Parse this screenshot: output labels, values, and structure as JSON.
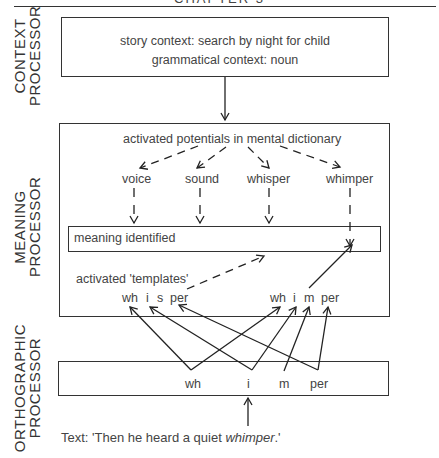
{
  "header": {
    "title": "CHAPTER 3"
  },
  "processors": {
    "context": {
      "label_line1": "CONTEXT",
      "label_line2": "PROCESSOR",
      "story_context": "story context: search by night for child",
      "grammatical_context": "grammatical context: noun"
    },
    "meaning": {
      "label_line1": "MEANING",
      "label_line2": "PROCESSOR",
      "dictionary_label": "activated potentials in mental dictionary",
      "candidates": [
        "voice",
        "sound",
        "whisper",
        "whimper"
      ],
      "identified_label": "meaning identified",
      "templates_label": "activated 'templates'",
      "template_whisper": [
        "wh",
        "i",
        "s",
        "per"
      ],
      "template_whimper": [
        "wh",
        "i",
        "m",
        "per"
      ]
    },
    "orthographic": {
      "label_line1": "ORTHOGRAPHIC",
      "label_line2": "PROCESSOR",
      "segments": [
        "wh",
        "i",
        "m",
        "per"
      ]
    }
  },
  "input_text": {
    "prefix": "Text: 'Then he heard a quiet ",
    "emphasis": "whimper",
    "suffix": ".'"
  }
}
